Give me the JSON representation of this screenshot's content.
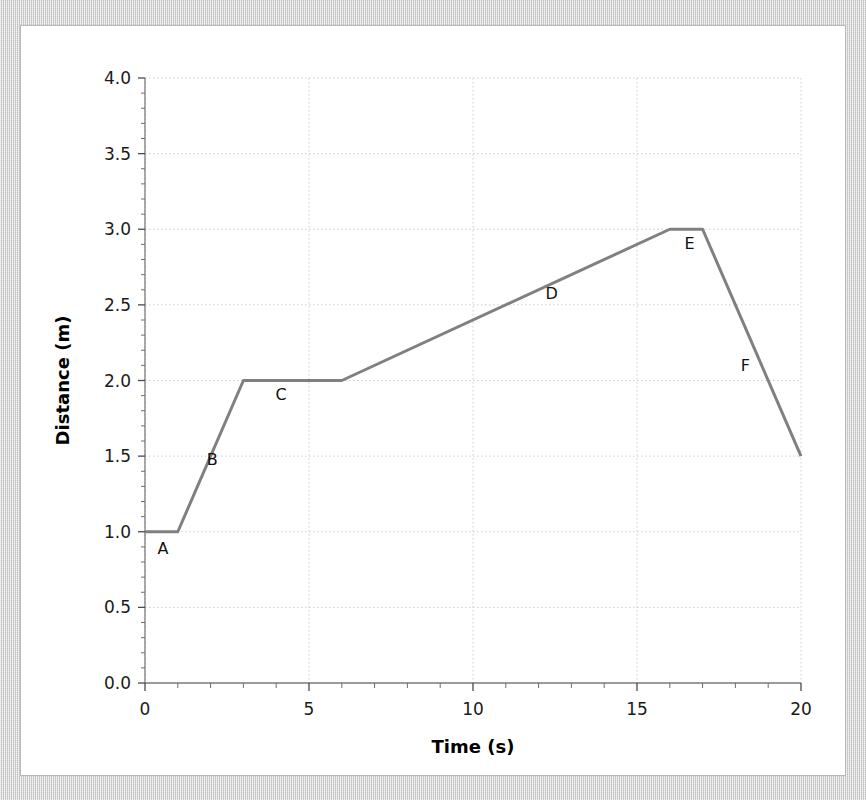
{
  "figure": {
    "background_color": "#d4d4d4",
    "card_color": "#ffffff",
    "card_border_color": "#b9b9b9"
  },
  "chart_data": {
    "type": "line",
    "title": "",
    "xlabel": "Time (s)",
    "ylabel": "Distance (m)",
    "xlim": [
      0,
      20
    ],
    "ylim": [
      0,
      4
    ],
    "grid": true,
    "grid_style": "dotted",
    "grid_color": "#cccccc",
    "legend": "none",
    "line_color": "#808080",
    "line_width": 3,
    "xticks": [
      0,
      5,
      10,
      15,
      20
    ],
    "xtick_labels": [
      "0",
      "5",
      "10",
      "15",
      "20"
    ],
    "x_minor_tick_interval": 1,
    "yticks": [
      0.0,
      0.5,
      1.0,
      1.5,
      2.0,
      2.5,
      3.0,
      3.5,
      4.0
    ],
    "ytick_labels": [
      "0.0",
      "0.5",
      "1.0",
      "1.5",
      "2.0",
      "2.5",
      "3.0",
      "3.5",
      "4.0"
    ],
    "y_minor_tick_interval": 0.1,
    "x": [
      0,
      1,
      3,
      6,
      16,
      17,
      20
    ],
    "y": [
      1.0,
      1.0,
      2.0,
      2.0,
      3.0,
      3.0,
      1.5
    ],
    "points": [
      {
        "x": 0,
        "y": 1.0
      },
      {
        "x": 1,
        "y": 1.0
      },
      {
        "x": 3,
        "y": 2.0
      },
      {
        "x": 6,
        "y": 2.0
      },
      {
        "x": 16,
        "y": 3.0
      },
      {
        "x": 17,
        "y": 3.0
      },
      {
        "x": 20,
        "y": 1.5
      }
    ],
    "segment_labels": [
      {
        "id": "A",
        "label": "A",
        "x": 0.55,
        "y": 0.85,
        "description": "stationary at 1.0 m from 0 s to 1 s"
      },
      {
        "id": "B",
        "label": "B",
        "x": 2.05,
        "y": 1.44,
        "description": "moving away, 1.0 m to 2.0 m between 1 s and 3 s"
      },
      {
        "id": "C",
        "label": "C",
        "x": 4.15,
        "y": 1.87,
        "description": "stationary at 2.0 m from 3 s to 6 s"
      },
      {
        "id": "D",
        "label": "D",
        "x": 12.4,
        "y": 2.54,
        "description": "moving away slowly, 2.0 m to 3.0 m between 6 s and 16 s"
      },
      {
        "id": "E",
        "label": "E",
        "x": 16.6,
        "y": 2.87,
        "description": "stationary at 3.0 m from 16 s to 17 s"
      },
      {
        "id": "F",
        "label": "F",
        "x": 18.3,
        "y": 2.06,
        "description": "returning, 3.0 m to 1.5 m between 17 s and 20 s"
      }
    ]
  }
}
